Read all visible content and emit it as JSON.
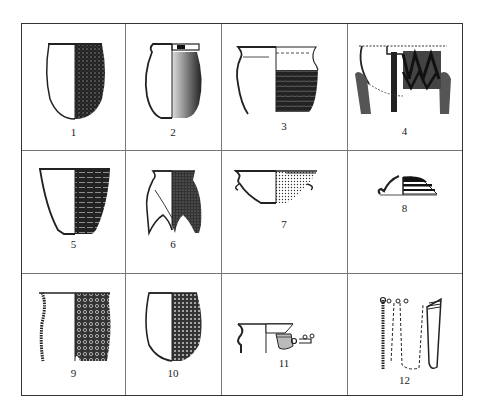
{
  "figure": {
    "type": "pottery-typology-plate",
    "rows": 3,
    "columns": 4,
    "line_color": "#333333",
    "fill_color": "#1a1a1a",
    "cells": [
      {
        "number": "1",
        "vessel": "ovoid jar, roughened exterior",
        "icon": "round-bottom-jar-icon"
      },
      {
        "number": "2",
        "vessel": "everted-rim jar, flat base",
        "icon": "flared-rim-jar-icon"
      },
      {
        "number": "3",
        "vessel": "flared-rim jar, cord-marked",
        "icon": "cord-marked-jar-icon"
      },
      {
        "number": "4",
        "vessel": "tripod vessel, zigzag decoration",
        "icon": "tripod-jar-icon"
      },
      {
        "number": "5",
        "vessel": "deep bowl, horizontal cord bands",
        "icon": "deep-bowl-icon"
      },
      {
        "number": "6",
        "vessel": "li tripod, hollow legs",
        "icon": "li-tripod-icon"
      },
      {
        "number": "7",
        "vessel": "basin with lug handles",
        "icon": "basin-icon"
      },
      {
        "number": "8",
        "vessel": "lid with banded exterior",
        "icon": "lid-icon"
      },
      {
        "number": "9",
        "vessel": "straight-wall jar, net-pattern",
        "icon": "net-pattern-jar-icon"
      },
      {
        "number": "10",
        "vessel": "round-bottom jar, dotted pattern",
        "icon": "dotted-jar-icon"
      },
      {
        "number": "11",
        "vessel": "rim fragment with handle",
        "icon": "rim-fragment-icon"
      },
      {
        "number": "12",
        "vessel": "cylindrical cup reconstruction",
        "icon": "cup-section-icon"
      }
    ]
  }
}
